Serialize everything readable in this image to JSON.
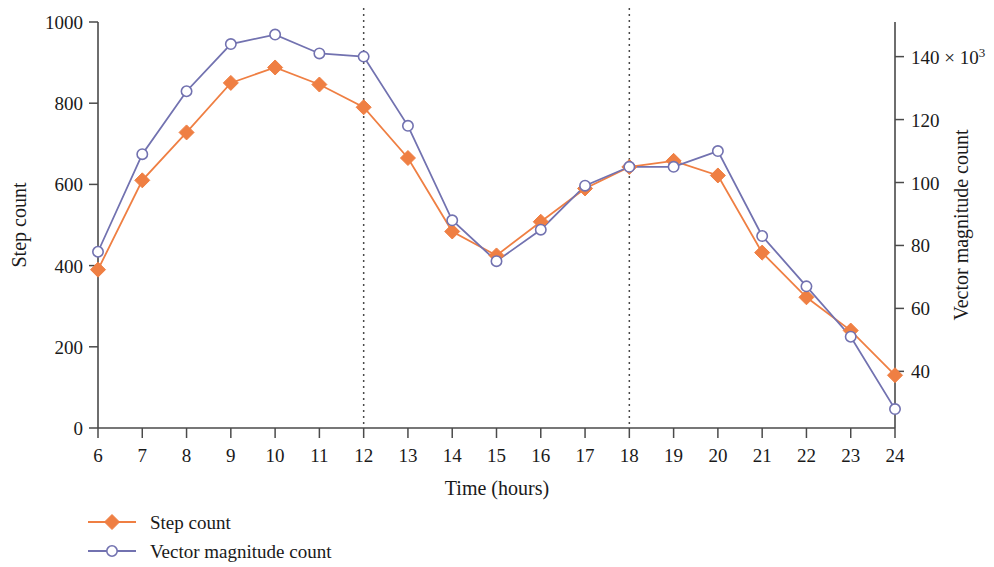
{
  "chart_data": {
    "type": "line",
    "title": "",
    "xlabel": "Time (hours)",
    "ylabel": "Step count",
    "y2label": "Vector magnitude count",
    "y2_exponent_label": "140 × 10³",
    "x": [
      6,
      7,
      8,
      9,
      10,
      11,
      12,
      13,
      14,
      15,
      16,
      17,
      18,
      19,
      20,
      21,
      22,
      23,
      24
    ],
    "xticklabels": [
      "6",
      "7",
      "8",
      "9",
      "10",
      "11",
      "12",
      "13",
      "14",
      "15",
      "16",
      "17",
      "18",
      "19",
      "20",
      "21",
      "22",
      "23",
      "24"
    ],
    "xlim": [
      6,
      24
    ],
    "ylim": [
      0,
      1000
    ],
    "yticks": [
      0,
      200,
      400,
      600,
      800,
      1000
    ],
    "yticklabels": [
      "0",
      "200",
      "400",
      "600",
      "800",
      "1000"
    ],
    "y2lim": [
      22,
      151
    ],
    "y2ticks": [
      40,
      60,
      80,
      100,
      120,
      140
    ],
    "y2ticklabels": [
      "40",
      "60",
      "80",
      "100",
      "120",
      "140"
    ],
    "y2_unit": "× 10³",
    "grid": false,
    "legend_position": "bottom-left",
    "annotations": [
      {
        "type": "vline",
        "x": 12,
        "style": "dotted"
      },
      {
        "type": "vline",
        "x": 18,
        "style": "dotted"
      }
    ],
    "series": [
      {
        "name": "Step count",
        "axis": "left",
        "color": "#ef7f43",
        "marker": "filled-diamond",
        "values": [
          390,
          610,
          728,
          850,
          888,
          846,
          790,
          665,
          484,
          425,
          508,
          590,
          643,
          658,
          622,
          432,
          322,
          240,
          130
        ]
      },
      {
        "name": "Vector magnitude count",
        "axis": "right",
        "color": "#7272b0",
        "marker": "open-circle",
        "values": [
          78,
          109,
          129,
          144,
          147,
          141,
          140,
          118,
          88,
          75,
          85,
          99,
          105,
          105,
          110,
          83,
          67,
          51,
          28
        ]
      }
    ]
  },
  "legend": {
    "items": [
      {
        "label": "Step count",
        "color": "#ef7f43",
        "marker": "filled-diamond"
      },
      {
        "label": "Vector magnitude count",
        "color": "#7272b0",
        "marker": "open-circle"
      }
    ]
  }
}
